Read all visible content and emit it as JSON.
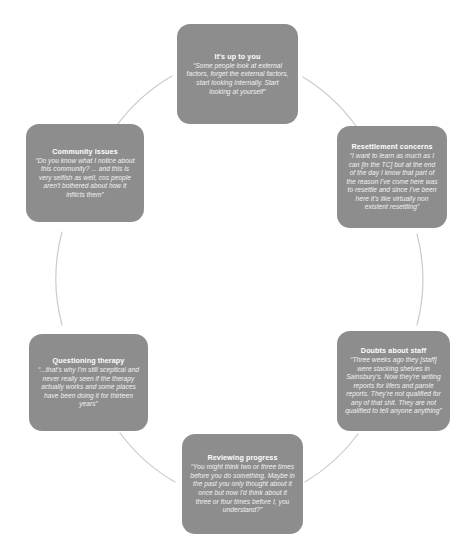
{
  "diagram": {
    "type": "cycle",
    "background_color": "#ffffff",
    "node_color": "#8d8d8d",
    "node_text_color": "#ffffff",
    "connector_color": "#cfcfcf",
    "nodes": [
      {
        "id": "its-up-to-you",
        "title": "It's up to you",
        "quote": "“Some people look at external factors, forget the external factors, start looking internally. Start looking at yourself”"
      },
      {
        "id": "resettlement-concerns",
        "title": "Resettlement concerns",
        "quote": "“I want to learn as much as I can [in the TC] but at the end of the day I know that part of the reason I've come here was to resettle and since I've been here it's like virtually non existent resettling”"
      },
      {
        "id": "doubts-about-staff",
        "title": "Doubts about staff",
        "quote": "“Three weeks ago they [staff] were stacking shelves in Sainsbury's. Now they're writing reports for lifers and parole reports. They're not qualified for any of that shit. They are not qualified to tell anyone anything”"
      },
      {
        "id": "reviewing-progress",
        "title": "Reviewing progress",
        "quote": "“You might think two or three times before you do something. Maybe in the past you only thought about it once but now I'd think about it three or four times before I, you understand?”"
      },
      {
        "id": "questioning-therapy",
        "title": "Questioning therapy",
        "quote": "“...that's why I'm still sceptical and never really seen if the therapy actually works and some places have been doing it for thirteen years”"
      },
      {
        "id": "community-issues",
        "title": "Community issues",
        "quote": "“Do you know what I notice about this community? ... and this is very selfish as well, cos people aren't bothered about how it inflicts them”"
      }
    ]
  }
}
